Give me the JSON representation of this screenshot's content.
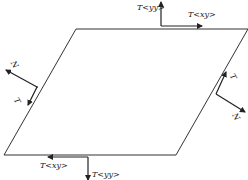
{
  "diagram": {
    "type": "stress element (parallelogram) with traction vectors",
    "colors": {
      "line": "#333333",
      "arrow": "#222222",
      "background": "#ffffff"
    },
    "element": {
      "shape": "parallelogram",
      "corners": [
        [
          76,
          29
        ],
        [
          248,
          29
        ],
        [
          176,
          155
        ],
        [
          4,
          155
        ]
      ]
    },
    "labels": {
      "top_normal": "T<yy>",
      "top_shear": "T<xy>",
      "left_normal": "N",
      "left_tangent": "T",
      "right_normal": "N",
      "right_tangent": "T",
      "bottom_shear": "T<xy>",
      "bottom_normal": "T<yy>"
    }
  }
}
